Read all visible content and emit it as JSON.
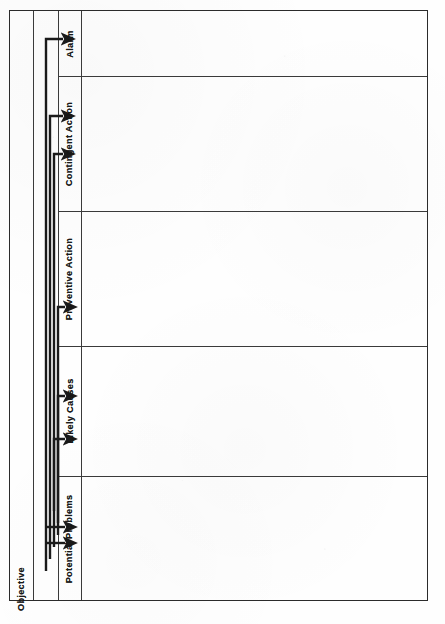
{
  "document": {
    "orientation": "landscape-rotated",
    "background_color": "#fefefe",
    "ink_color": "#2b2b2b"
  },
  "objective": {
    "label": "Objective"
  },
  "columns": [
    {
      "id": "potential-problems",
      "label": "Potential Problems"
    },
    {
      "id": "likely-causes",
      "label": "Likely Causes"
    },
    {
      "id": "preventive-action",
      "label": "Preventive Action"
    },
    {
      "id": "contingent-action",
      "label": "Contingent Action"
    },
    {
      "id": "alarm",
      "label": "Alarm"
    }
  ],
  "rows": [
    {
      "id": "row-potential-problems",
      "value": ""
    },
    {
      "id": "row-likely-causes",
      "value": ""
    },
    {
      "id": "row-preventive-action",
      "value": ""
    },
    {
      "id": "row-contingent-action",
      "value": ""
    },
    {
      "id": "row-alarm",
      "value": ""
    }
  ],
  "connectors": {
    "count": 7,
    "style": "bracket-arrow",
    "direction": "left-to-right"
  }
}
